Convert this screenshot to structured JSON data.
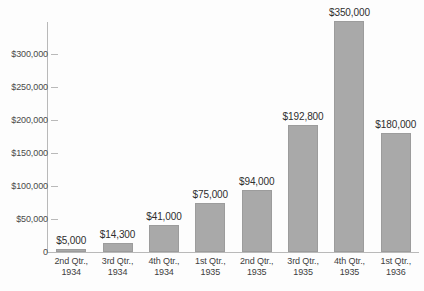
{
  "chart_data": {
    "type": "bar",
    "title": "",
    "subtitle": "",
    "xlabel": "",
    "ylabel": "",
    "categories": [
      "2nd Qtr., 1934",
      "3rd Qtr., 1934",
      "4th Qtr., 1934",
      "1st Qtr., 1935",
      "2nd Qtr., 1935",
      "3rd Qtr., 1935",
      "4th Qtr., 1935",
      "1st Qtr., 1936"
    ],
    "category_lines": [
      [
        "2nd Qtr.,",
        "1934"
      ],
      [
        "3rd Qtr.,",
        "1934"
      ],
      [
        "4th Qtr.,",
        "1934"
      ],
      [
        "1st Qtr.,",
        "1935"
      ],
      [
        "2nd Qtr.,",
        "1935"
      ],
      [
        "3rd Qtr.,",
        "1935"
      ],
      [
        "4th Qtr.,",
        "1935"
      ],
      [
        "1st Qtr.,",
        "1936"
      ]
    ],
    "values": [
      5000,
      14300,
      41000,
      75000,
      94000,
      192800,
      350000,
      180000
    ],
    "data_labels": [
      "$5,000",
      "$14,300",
      "$41,000",
      "$75,000",
      "$94,000",
      "$192,800",
      "$350,000",
      "$180,000"
    ],
    "ylim": [
      0,
      350000
    ],
    "y_ticks": [
      0,
      50000,
      100000,
      150000,
      200000,
      250000,
      300000
    ],
    "y_tick_labels": [
      "0",
      "$50,000",
      "$100,000",
      "$150,000",
      "$200,000",
      "$250,000",
      "$300,000"
    ],
    "grid": false,
    "legend": "none",
    "bar_color": "#a9a9a9",
    "bar_edge_color": "#9c9c9c",
    "axis_color": "#b9b9b9",
    "text_color": "#3d3d3d",
    "background_color": "#fdfdfd"
  }
}
